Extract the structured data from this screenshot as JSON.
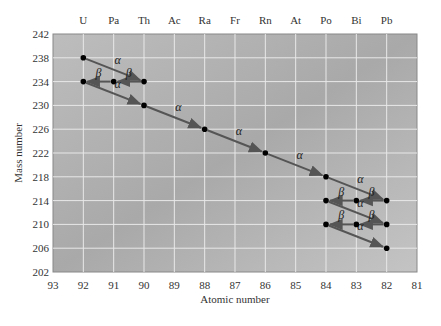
{
  "chart_data": {
    "type": "scatter",
    "title": "",
    "xlabel": "Atomic number",
    "ylabel": "Mass number",
    "xlim": [
      93,
      81
    ],
    "ylim": [
      202,
      242
    ],
    "x_ticks": [
      93,
      92,
      91,
      90,
      89,
      88,
      87,
      86,
      85,
      84,
      83,
      82,
      81
    ],
    "y_ticks": [
      242,
      238,
      234,
      230,
      226,
      222,
      218,
      214,
      210,
      206,
      202
    ],
    "top_element_labels": [
      {
        "z": 92,
        "symbol": "U"
      },
      {
        "z": 91,
        "symbol": "Pa"
      },
      {
        "z": 90,
        "symbol": "Th"
      },
      {
        "z": 89,
        "symbol": "Ac"
      },
      {
        "z": 88,
        "symbol": "Ra"
      },
      {
        "z": 87,
        "symbol": "Fr"
      },
      {
        "z": 86,
        "symbol": "Rn"
      },
      {
        "z": 85,
        "symbol": "At"
      },
      {
        "z": 84,
        "symbol": "Po"
      },
      {
        "z": 83,
        "symbol": "Bi"
      },
      {
        "z": 82,
        "symbol": "Pb"
      }
    ],
    "grid": true,
    "points": [
      {
        "z": 92,
        "a": 238
      },
      {
        "z": 90,
        "a": 234
      },
      {
        "z": 91,
        "a": 234
      },
      {
        "z": 92,
        "a": 234
      },
      {
        "z": 90,
        "a": 230
      },
      {
        "z": 88,
        "a": 226
      },
      {
        "z": 86,
        "a": 222
      },
      {
        "z": 84,
        "a": 218
      },
      {
        "z": 82,
        "a": 214
      },
      {
        "z": 83,
        "a": 214
      },
      {
        "z": 84,
        "a": 214
      },
      {
        "z": 82,
        "a": 210
      },
      {
        "z": 83,
        "a": 210
      },
      {
        "z": 84,
        "a": 210
      },
      {
        "z": 82,
        "a": 206
      }
    ],
    "decays": [
      {
        "from": [
          92,
          238
        ],
        "to": [
          90,
          234
        ],
        "type": "alpha",
        "label": "α"
      },
      {
        "from": [
          90,
          234
        ],
        "to": [
          91,
          234
        ],
        "type": "beta",
        "label": "β"
      },
      {
        "from": [
          91,
          234
        ],
        "to": [
          92,
          234
        ],
        "type": "beta",
        "label": "β"
      },
      {
        "from": [
          92,
          234
        ],
        "to": [
          90,
          230
        ],
        "type": "alpha",
        "label": "α"
      },
      {
        "from": [
          90,
          230
        ],
        "to": [
          88,
          226
        ],
        "type": "alpha",
        "label": "α"
      },
      {
        "from": [
          88,
          226
        ],
        "to": [
          86,
          222
        ],
        "type": "alpha",
        "label": "α"
      },
      {
        "from": [
          86,
          222
        ],
        "to": [
          84,
          218
        ],
        "type": "alpha",
        "label": "α"
      },
      {
        "from": [
          84,
          218
        ],
        "to": [
          82,
          214
        ],
        "type": "alpha",
        "label": "α"
      },
      {
        "from": [
          82,
          214
        ],
        "to": [
          83,
          214
        ],
        "type": "beta",
        "label": "β"
      },
      {
        "from": [
          83,
          214
        ],
        "to": [
          84,
          214
        ],
        "type": "beta",
        "label": "β"
      },
      {
        "from": [
          84,
          214
        ],
        "to": [
          82,
          210
        ],
        "type": "alpha",
        "label": "α"
      },
      {
        "from": [
          82,
          210
        ],
        "to": [
          83,
          210
        ],
        "type": "beta",
        "label": "β"
      },
      {
        "from": [
          83,
          210
        ],
        "to": [
          84,
          210
        ],
        "type": "beta",
        "label": "β"
      },
      {
        "from": [
          84,
          210
        ],
        "to": [
          82,
          206
        ],
        "type": "alpha",
        "label": "α"
      }
    ]
  },
  "labels": {
    "xlabel": "Atomic number",
    "ylabel": "Mass number"
  }
}
